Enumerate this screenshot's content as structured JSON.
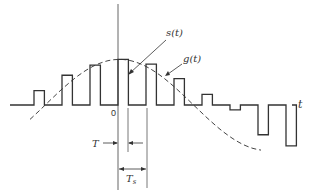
{
  "figure": {
    "labels": {
      "signal_sampled": "s(t)",
      "signal_continuous": "g(t)",
      "time_axis": "t",
      "origin": "0",
      "pulse_width": "T",
      "sampling_period": "T",
      "sampling_period_sub": "s"
    },
    "colors": {
      "stroke": "#333333",
      "axis": "#555555",
      "background": "#ffffff"
    },
    "samples": {
      "description": "Pulse amplitudes (relative units, positive up) at sample indices n = -3..5; pulse width T, period Ts",
      "index": [
        -3,
        -2,
        -1,
        0,
        1,
        2,
        3,
        4,
        5
      ],
      "amplitude": [
        0.3,
        0.62,
        0.83,
        0.95,
        0.85,
        0.55,
        0.22,
        -0.1,
        -0.62,
        -0.85
      ],
      "pulse_width_ratio": 0.3
    }
  }
}
